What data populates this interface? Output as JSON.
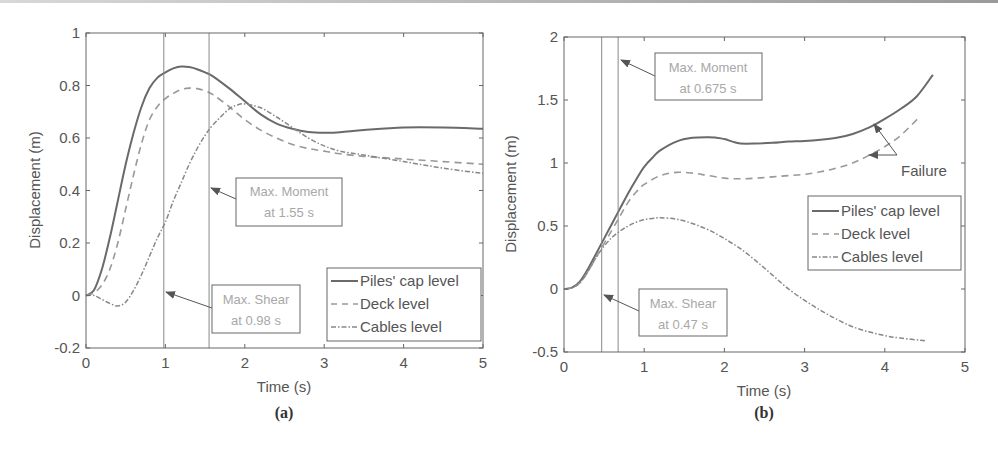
{
  "chart_data": [
    {
      "type": "line",
      "panel": "(a)",
      "title": "",
      "xlabel": "Time (s)",
      "ylabel": "Displacement (m)",
      "xlim": [
        0,
        5
      ],
      "ylim": [
        -0.2,
        1
      ],
      "xticks": [
        "0",
        "1",
        "2",
        "3",
        "4",
        "5"
      ],
      "yticks": [
        "-0.2",
        "0",
        "0.2",
        "0.4",
        "0.6",
        "0.8",
        "1"
      ],
      "grid": false,
      "legend_position": "lower right",
      "series": [
        {
          "name": "Piles' cap level",
          "style": "solid",
          "x": [
            0,
            0.1,
            0.2,
            0.3,
            0.4,
            0.5,
            0.6,
            0.7,
            0.8,
            0.9,
            1.0,
            1.1,
            1.2,
            1.3,
            1.4,
            1.5,
            1.6,
            1.8,
            2.0,
            2.2,
            2.4,
            2.6,
            2.8,
            3.0,
            3.2,
            3.5,
            4.0,
            4.5,
            5.0
          ],
          "y": [
            0,
            0.02,
            0.1,
            0.22,
            0.36,
            0.5,
            0.62,
            0.72,
            0.79,
            0.83,
            0.85,
            0.865,
            0.872,
            0.87,
            0.862,
            0.85,
            0.835,
            0.79,
            0.74,
            0.69,
            0.655,
            0.635,
            0.623,
            0.62,
            0.622,
            0.63,
            0.64,
            0.64,
            0.635
          ]
        },
        {
          "name": "Deck level",
          "style": "dashed",
          "x": [
            0,
            0.1,
            0.2,
            0.3,
            0.4,
            0.5,
            0.6,
            0.7,
            0.8,
            0.9,
            1.0,
            1.1,
            1.2,
            1.3,
            1.4,
            1.5,
            1.6,
            1.8,
            2.0,
            2.2,
            2.4,
            2.6,
            2.8,
            3.0,
            3.2,
            3.5,
            4.0,
            4.5,
            5.0
          ],
          "y": [
            0,
            0.01,
            0.04,
            0.1,
            0.2,
            0.33,
            0.46,
            0.58,
            0.67,
            0.72,
            0.75,
            0.77,
            0.785,
            0.79,
            0.788,
            0.78,
            0.765,
            0.72,
            0.67,
            0.63,
            0.6,
            0.575,
            0.56,
            0.55,
            0.54,
            0.53,
            0.52,
            0.51,
            0.5
          ]
        },
        {
          "name": "Cables level",
          "style": "dashdot",
          "x": [
            0,
            0.1,
            0.2,
            0.3,
            0.4,
            0.5,
            0.6,
            0.7,
            0.8,
            0.9,
            1.0,
            1.1,
            1.2,
            1.3,
            1.4,
            1.5,
            1.6,
            1.8,
            1.9,
            2.0,
            2.2,
            2.4,
            2.6,
            2.8,
            3.0,
            3.2,
            3.5,
            4.0,
            4.5,
            5.0
          ],
          "y": [
            0,
            0,
            -0.015,
            -0.03,
            -0.04,
            -0.025,
            0.02,
            0.08,
            0.15,
            0.22,
            0.28,
            0.36,
            0.43,
            0.5,
            0.56,
            0.61,
            0.65,
            0.71,
            0.725,
            0.73,
            0.715,
            0.68,
            0.64,
            0.6,
            0.57,
            0.55,
            0.535,
            0.51,
            0.485,
            0.465
          ]
        }
      ],
      "vlines": [
        0.98,
        1.55
      ],
      "annotations": [
        {
          "line1": "Max. Moment",
          "line2": "at 1.55 s",
          "points_to_x": 1.55,
          "points_to_y": 0.38
        },
        {
          "line1": "Max. Shear",
          "line2": "at 0.98 s",
          "points_to_x": 0.98,
          "points_to_y": 0.02
        }
      ],
      "caption": "(a)"
    },
    {
      "type": "line",
      "panel": "(b)",
      "title": "",
      "xlabel": "Time (s)",
      "ylabel": "Displacement (m)",
      "xlim": [
        0,
        5
      ],
      "ylim": [
        -0.5,
        2
      ],
      "xticks": [
        "0",
        "1",
        "2",
        "3",
        "4",
        "5"
      ],
      "yticks": [
        "-0.5",
        "0",
        "0.5",
        "1",
        "1.5",
        "2"
      ],
      "grid": false,
      "legend_position": "center right",
      "series": [
        {
          "name": "Piles' cap level",
          "style": "solid",
          "x": [
            0,
            0.1,
            0.2,
            0.3,
            0.4,
            0.5,
            0.6,
            0.7,
            0.8,
            0.9,
            1.0,
            1.1,
            1.2,
            1.4,
            1.6,
            1.8,
            1.9,
            2.0,
            2.1,
            2.2,
            2.4,
            2.6,
            2.8,
            3.0,
            3.2,
            3.4,
            3.6,
            3.8,
            4.0,
            4.2,
            4.4,
            4.6
          ],
          "y": [
            0,
            0.01,
            0.06,
            0.16,
            0.28,
            0.4,
            0.52,
            0.64,
            0.76,
            0.87,
            0.97,
            1.04,
            1.1,
            1.17,
            1.2,
            1.205,
            1.2,
            1.19,
            1.17,
            1.155,
            1.155,
            1.16,
            1.17,
            1.175,
            1.185,
            1.2,
            1.23,
            1.28,
            1.35,
            1.43,
            1.53,
            1.7
          ]
        },
        {
          "name": "Deck level",
          "style": "dashed",
          "x": [
            0,
            0.1,
            0.2,
            0.3,
            0.4,
            0.5,
            0.6,
            0.7,
            0.8,
            0.9,
            1.0,
            1.2,
            1.4,
            1.6,
            1.8,
            2.0,
            2.2,
            2.4,
            2.6,
            2.8,
            3.0,
            3.2,
            3.4,
            3.6,
            3.8,
            4.0,
            4.2,
            4.44
          ],
          "y": [
            0,
            0.01,
            0.05,
            0.14,
            0.25,
            0.36,
            0.47,
            0.58,
            0.69,
            0.77,
            0.83,
            0.9,
            0.925,
            0.92,
            0.9,
            0.88,
            0.875,
            0.88,
            0.89,
            0.9,
            0.91,
            0.93,
            0.96,
            1.0,
            1.06,
            1.13,
            1.22,
            1.37
          ]
        },
        {
          "name": "Cables level",
          "style": "dashdot",
          "x": [
            0,
            0.1,
            0.2,
            0.3,
            0.4,
            0.5,
            0.6,
            0.7,
            0.8,
            0.9,
            1.0,
            1.1,
            1.2,
            1.4,
            1.6,
            1.8,
            2.0,
            2.2,
            2.4,
            2.6,
            2.8,
            3.0,
            3.2,
            3.4,
            3.6,
            3.8,
            4.0,
            4.2,
            4.5
          ],
          "y": [
            0,
            0.01,
            0.05,
            0.14,
            0.25,
            0.34,
            0.41,
            0.46,
            0.5,
            0.53,
            0.55,
            0.56,
            0.565,
            0.555,
            0.52,
            0.47,
            0.4,
            0.32,
            0.22,
            0.11,
            0.0,
            -0.09,
            -0.17,
            -0.24,
            -0.3,
            -0.34,
            -0.37,
            -0.39,
            -0.41
          ]
        }
      ],
      "vlines": [
        0.47,
        0.675
      ],
      "annotations": [
        {
          "line1": "Max. Moment",
          "line2": "at 0.675 s",
          "points_to_x": 0.675,
          "points_to_y": 1.83
        },
        {
          "line1": "Max. Shear",
          "line2": "at 0.47 s",
          "points_to_x": 0.47,
          "points_to_y": -0.03
        },
        {
          "text": "Failure",
          "arrows_to": [
            {
              "x": 3.87,
              "y": 1.27
            },
            {
              "x": 3.83,
              "y": 1.05
            }
          ]
        }
      ],
      "caption": "(b)"
    }
  ],
  "labels": {
    "a": {
      "xlabel": "Time (s)",
      "ylabel": "Displacement (m)",
      "caption": "(a)",
      "xticks": [
        "0",
        "1",
        "2",
        "3",
        "4",
        "5"
      ],
      "yticks": [
        "-0.2",
        "0",
        "0.2",
        "0.4",
        "0.6",
        "0.8",
        "1"
      ],
      "moment_l1": "Max. Moment",
      "moment_l2": "at 1.55 s",
      "shear_l1": "Max. Shear",
      "shear_l2": "at 0.98 s",
      "legend": [
        "Piles' cap level",
        "Deck level",
        "Cables level"
      ]
    },
    "b": {
      "xlabel": "Time (s)",
      "ylabel": "Displacement (m)",
      "caption": "(b)",
      "xticks": [
        "0",
        "1",
        "2",
        "3",
        "4",
        "5"
      ],
      "yticks": [
        "-0.5",
        "0",
        "0.5",
        "1",
        "1.5",
        "2"
      ],
      "moment_l1": "Max. Moment",
      "moment_l2": "at 0.675 s",
      "shear_l1": "Max. Shear",
      "shear_l2": "at 0.47 s",
      "failure": "Failure",
      "legend": [
        "Piles' cap level",
        "Deck level",
        "Cables level"
      ]
    }
  },
  "colors": {
    "axis": "#555555",
    "series_solid": "#6a6a6a",
    "series_dashed": "#999999",
    "series_dashdot": "#888888",
    "annotation_text": "#a8a8a8"
  }
}
